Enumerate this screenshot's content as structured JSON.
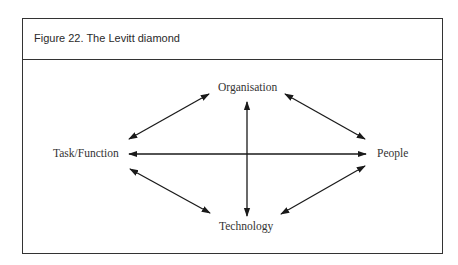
{
  "figure": {
    "title": "Figure 22. The Levitt diamond"
  },
  "nodes": {
    "top": "Organisation",
    "left": "Task/Function",
    "right": "People",
    "bottom": "Technology"
  },
  "colors": {
    "line": "#1a1a1a",
    "border": "#333333",
    "text": "#333333"
  }
}
